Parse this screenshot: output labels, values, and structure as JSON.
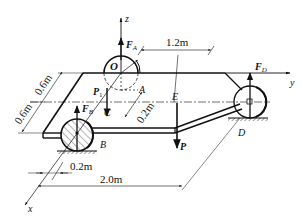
{
  "diagram": {
    "type": "mechanics-free-body",
    "axes": {
      "x": "x",
      "y": "y",
      "z": "z"
    },
    "points": {
      "O": "O",
      "A": "A",
      "B": "B",
      "C": "C",
      "D": "D",
      "E": "E"
    },
    "forces": {
      "FA": {
        "symbol": "F",
        "sub": "A"
      },
      "FB": {
        "symbol": "F",
        "sub": "B"
      },
      "FD": {
        "symbol": "F",
        "sub": "D"
      },
      "P1": {
        "symbol": "P",
        "sub": "1"
      },
      "P": {
        "symbol": "P"
      }
    },
    "dimensions": {
      "d_top": "1.2m",
      "d_left_upper": "0.6m",
      "d_left_lower": "0.6m",
      "d_mid": "0.2m",
      "d_bottom_small": "0.2m",
      "d_bottom_long": "2.0m"
    },
    "colors": {
      "ink": "#111111",
      "background": "#ffffff"
    }
  }
}
